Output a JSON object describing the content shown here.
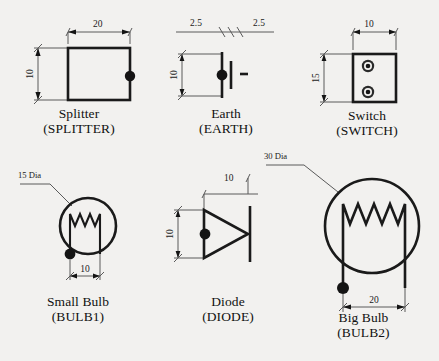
{
  "sheet": {
    "title": "Electrical Symbol Library",
    "background_color": "#f2f1ef",
    "line_color": "#1a1a1a",
    "dimension_color": "#5a5a5a"
  },
  "symbols": [
    {
      "id": "splitter",
      "name": "Splitter",
      "code": "(SPLITTER)",
      "shape": "rectangle",
      "dimensions": [
        {
          "label": "20",
          "orientation": "horizontal",
          "position": "top"
        },
        {
          "label": "10",
          "orientation": "vertical",
          "position": "left"
        }
      ],
      "connection_points": 1
    },
    {
      "id": "earth",
      "name": "Earth",
      "code": "(EARTH)",
      "shape": "ground-bars",
      "dimensions": [
        {
          "label": "2.5",
          "orientation": "horizontal",
          "position": "top-left"
        },
        {
          "label": "2.5",
          "orientation": "horizontal",
          "position": "top-right"
        },
        {
          "label": "10",
          "orientation": "vertical",
          "position": "left"
        }
      ],
      "connection_points": 1
    },
    {
      "id": "switch",
      "name": "Switch",
      "code": "(SWITCH)",
      "shape": "rectangle-two-terminals",
      "dimensions": [
        {
          "label": "10",
          "orientation": "horizontal",
          "position": "top"
        },
        {
          "label": "15",
          "orientation": "vertical",
          "position": "left"
        }
      ],
      "connection_points": 2
    },
    {
      "id": "bulb1",
      "name": "Small Bulb",
      "code": "(BULB1)",
      "shape": "circle-filament",
      "dimensions": [
        {
          "label": "15 Dia",
          "orientation": "leader",
          "position": "upper-left"
        },
        {
          "label": "10",
          "orientation": "horizontal",
          "position": "bottom"
        }
      ],
      "filament_peaks": 3,
      "connection_points": 1
    },
    {
      "id": "diode",
      "name": "Diode",
      "code": "(DIODE)",
      "shape": "triangle-bar",
      "dimensions": [
        {
          "label": "10",
          "orientation": "horizontal",
          "position": "top"
        },
        {
          "label": "10",
          "orientation": "vertical",
          "position": "left"
        }
      ],
      "connection_points": 1
    },
    {
      "id": "bulb2",
      "name": "Big Bulb",
      "code": "(BULB2)",
      "shape": "circle-filament",
      "dimensions": [
        {
          "label": "30 Dia",
          "orientation": "leader",
          "position": "upper-left"
        },
        {
          "label": "20",
          "orientation": "horizontal",
          "position": "bottom"
        }
      ],
      "filament_peaks": 4,
      "connection_points": 1
    }
  ]
}
